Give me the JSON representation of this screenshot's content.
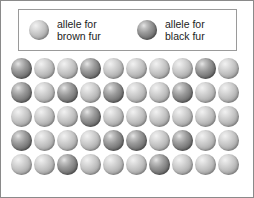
{
  "legend": {
    "entries": [
      {
        "swatch_type": "light",
        "swatch_color": "#c2c2c2",
        "label": "allele for\nbrown fur",
        "trait": "brown fur"
      },
      {
        "swatch_type": "dark",
        "swatch_color": "#7c7c7c",
        "label": "allele for\nblack fur",
        "trait": "black fur"
      }
    ]
  },
  "chart_data": {
    "type": "table",
    "title": "",
    "rows": 5,
    "columns": 10,
    "total_alleles": 50,
    "categories": [
      "allele for brown fur",
      "allele for black fur"
    ],
    "values": [
      42,
      8
    ],
    "legend_position": "top",
    "grid": [
      [
        "dark",
        "light",
        "light",
        "dark",
        "light",
        "light",
        "light",
        "light",
        "dark",
        "light"
      ],
      [
        "dark",
        "light",
        "dark",
        "light",
        "dark",
        "light",
        "light",
        "dark",
        "light",
        "light"
      ],
      [
        "light",
        "light",
        "light",
        "dark",
        "light",
        "light",
        "light",
        "light",
        "light",
        "light"
      ],
      [
        "dark",
        "light",
        "light",
        "light",
        "dark",
        "dark",
        "light",
        "dark",
        "light",
        "light"
      ],
      [
        "light",
        "light",
        "dark",
        "light",
        "light",
        "light",
        "dark",
        "light",
        "light",
        "light"
      ]
    ]
  }
}
